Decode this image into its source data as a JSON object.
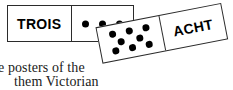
{
  "page": {
    "width": 233,
    "height": 90,
    "background_color": "#ffffff",
    "ink_color": "#000000",
    "border_color": "#2b2b2b"
  },
  "dominoes": [
    {
      "id": "trois",
      "word": "TROIS",
      "word_side": "left",
      "pip_count": 3,
      "pip_side": "right",
      "pip_rows": [
        3
      ],
      "rotation_degrees": 0,
      "language": "French"
    },
    {
      "id": "acht",
      "word": "ACHT",
      "word_side": "right",
      "pip_count": 8,
      "pip_side": "left",
      "pip_rows": [
        3,
        2,
        3
      ],
      "rotation_degrees": -11,
      "language": "German"
    }
  ],
  "body_text": {
    "line_1": "e posters of the",
    "line_2": "them Victorian"
  }
}
